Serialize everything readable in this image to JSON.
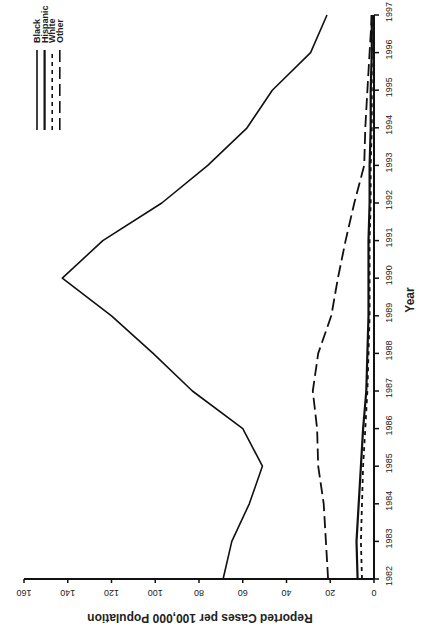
{
  "chart_data": {
    "type": "line",
    "title": "",
    "xlabel": "Year",
    "ylabel": "Reported Cases per 100,000 Population",
    "ylim": [
      0,
      160
    ],
    "yticks": [
      0,
      20,
      40,
      60,
      80,
      100,
      120,
      140,
      160
    ],
    "x": [
      1982,
      1983,
      1984,
      1985,
      1986,
      1987,
      1988,
      1989,
      1990,
      1991,
      1992,
      1993,
      1994,
      1995,
      1996,
      1997
    ],
    "grid": false,
    "legend_position": "top-right",
    "orientation_note": "figure is rotated 90 degrees counter-clockwise on the page",
    "series": [
      {
        "name": "Black",
        "style": "solid",
        "values": [
          69,
          65,
          57,
          51,
          60,
          83,
          101,
          120,
          142.5,
          124,
          97,
          76,
          58,
          46.5,
          29,
          21.5
        ]
      },
      {
        "name": "Hispanic",
        "style": "solid-thick",
        "values": [
          7.5,
          8,
          7,
          6,
          5,
          3.5,
          3,
          2.5,
          2.5,
          2.5,
          2,
          2,
          1.5,
          1.5,
          1,
          1
        ]
      },
      {
        "name": "White",
        "style": "short-dash",
        "values": [
          5.5,
          6,
          5.5,
          5,
          4,
          3,
          2.5,
          2,
          2,
          2,
          1.5,
          1.5,
          1,
          1,
          1,
          1
        ]
      },
      {
        "name": "Other",
        "style": "long-dash",
        "values": [
          21,
          22,
          23,
          25.5,
          26,
          28,
          25.5,
          19.5,
          16.5,
          13,
          9,
          4.5,
          4,
          3,
          2,
          1
        ]
      }
    ]
  },
  "axes": {
    "x_title": "Year",
    "y_title": "Reported Cases per 100,000 Population",
    "x_tick_labels": [
      "1982",
      "1983",
      "1984",
      "1985",
      "1986",
      "1987",
      "1988",
      "1989",
      "1990",
      "1991",
      "1992",
      "1993",
      "1994",
      "1995",
      "1996",
      "1997"
    ],
    "y_tick_labels": [
      "0",
      "20",
      "40",
      "60",
      "80",
      "100",
      "120",
      "140",
      "160"
    ]
  },
  "legend": {
    "items": [
      {
        "label": "Black",
        "dash": ""
      },
      {
        "label": "Hispanic",
        "dash": ""
      },
      {
        "label": "White",
        "dash": "4,4"
      },
      {
        "label": "Other",
        "dash": "12,5"
      }
    ]
  },
  "colors": {
    "ink": "#111111",
    "background": "#ffffff"
  }
}
